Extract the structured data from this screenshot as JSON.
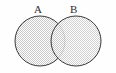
{
  "figure": {
    "type": "venn-diagram",
    "title": "",
    "background_color": "#fefefe",
    "width": 116,
    "height": 73
  },
  "labels": {
    "left_set": "A",
    "right_set": "B"
  },
  "style": {
    "outline_color": "#3a3a3a",
    "outline_width": 1,
    "fill_pattern": "dither-checkerboard",
    "fill_color_light": "#ffffff",
    "fill_color_dark": "#c9c9c9",
    "label_color": "#2b2b2b"
  },
  "geometry": {
    "left_circle": {
      "cx": 40,
      "cy": 41,
      "r": 25
    },
    "right_circle": {
      "cx": 76,
      "cy": 41,
      "r": 25
    },
    "label_a_anchor": {
      "x": 38,
      "y": 10
    },
    "label_b_anchor": {
      "x": 74,
      "y": 10
    }
  }
}
